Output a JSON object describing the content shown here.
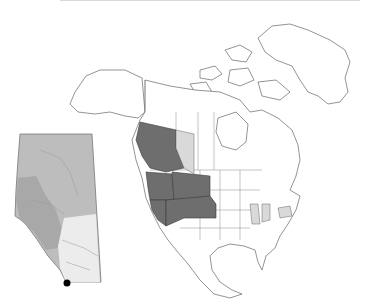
{
  "map": {
    "type": "range-distribution",
    "region": "North America",
    "colors": {
      "background": "#ffffff",
      "outline": "#555555",
      "range_primary": "#6e6e6e",
      "range_secondary": "#d9d9d9",
      "land": "#ffffff"
    },
    "highlighted_primary": [
      "British Columbia",
      "Washington",
      "Oregon",
      "Idaho",
      "Montana",
      "Wyoming",
      "Nevada",
      "Utah",
      "Colorado"
    ],
    "highlighted_secondary": [
      "Alberta",
      "Illinois",
      "Indiana",
      "Virginia"
    ],
    "inset": {
      "region": "Alberta",
      "colors": {
        "north": "#bdbdbd",
        "foothills": "#a8a8a8",
        "south_prairie": "#ececec",
        "point_marker": "#000000"
      }
    }
  }
}
